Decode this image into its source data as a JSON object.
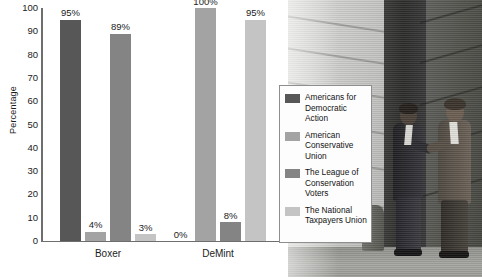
{
  "chart_data": {
    "type": "bar",
    "title": "",
    "xlabel": "",
    "ylabel": "Percentage",
    "ylim": [
      0,
      100
    ],
    "yticks": [
      0,
      10,
      20,
      30,
      40,
      50,
      60,
      70,
      80,
      90,
      100
    ],
    "grid": false,
    "legend_position": "right",
    "categories": [
      "Boxer",
      "DeMint"
    ],
    "series": [
      {
        "name": "Americans for Democratic Action",
        "short": "ADA",
        "color": "#575757",
        "values": [
          95,
          0
        ],
        "labels": [
          "95%",
          "0%"
        ]
      },
      {
        "name": "American Conservative Union",
        "short": "ACU",
        "color": "#a3a3a3",
        "values": [
          4,
          100
        ],
        "labels": [
          "4%",
          "100%"
        ]
      },
      {
        "name": "The League of Conservation Voters",
        "short": "LCV",
        "color": "#848484",
        "values": [
          89,
          8
        ],
        "labels": [
          "89%",
          "8%"
        ]
      },
      {
        "name": "The National Taxpayers Union",
        "short": "NTU",
        "color": "#c4c4c4",
        "values": [
          3,
          95
        ],
        "labels": [
          "3%",
          "95%"
        ]
      }
    ]
  },
  "legend": {
    "items": [
      {
        "label": "Americans for Democratic Action",
        "color": "#575757"
      },
      {
        "label": "American Conservative Union",
        "color": "#a3a3a3"
      },
      {
        "label": "The League of Conservation Voters",
        "color": "#848484"
      },
      {
        "label": "The National Taxpayers Union",
        "color": "#c4c4c4"
      }
    ]
  },
  "photo": {
    "description": "Two men in suits shaking hands outside a building"
  }
}
